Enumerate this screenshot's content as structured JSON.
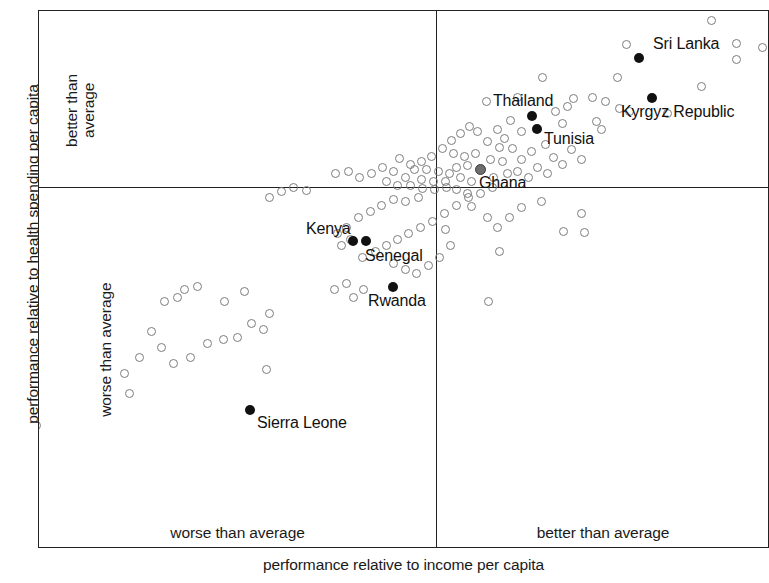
{
  "figure": {
    "type": "scatter",
    "x_axis_title": "performance relative to income per capita",
    "y_axis_title": "performance relative to health spending per capita",
    "quadrant_labels": {
      "y_upper": "better than\naverage",
      "y_upper_line1": "better than",
      "y_upper_line2": "average",
      "y_lower": "worse than average",
      "x_left": "worse than average",
      "x_right": "better than average"
    },
    "colors": {
      "frame": "#222222",
      "open_point": "#7c7c7c",
      "highlight_point": "#111111",
      "gray_point": "#6e6e6e",
      "text": "#1a1a1a",
      "background": "#ffffff"
    }
  },
  "chart_data": {
    "type": "scatter",
    "title": "",
    "xlabel": "performance relative to income per capita",
    "ylabel": "performance relative to health spending per capita",
    "grid": false,
    "legend": "none",
    "axis_origin_note": "Axes are divided into quadrants by an origin representing the average; no numeric tick labels are shown.",
    "quadrants": [
      "worse than average (income) / better than average (spending)",
      "better than average (income) / better than average (spending)",
      "worse than average (income) / worse than average (spending)",
      "better than average (income) / worse than average (spending)"
    ],
    "origin_px": {
      "x": 435,
      "y": 186
    },
    "plot_area_px": {
      "left": 38,
      "top": 10,
      "width": 731,
      "height": 538
    },
    "labeled_points": [
      {
        "name": "Sri Lanka",
        "style": "filled",
        "px": [
          638,
          57
        ],
        "label_px": [
          652,
          35
        ],
        "quadrant": "better/better"
      },
      {
        "name": "Kyrgyz Republic",
        "style": "filled",
        "px": [
          651,
          97
        ],
        "label_px": [
          620,
          103
        ],
        "quadrant": "better/better"
      },
      {
        "name": "Thailand",
        "style": "filled",
        "px": [
          531,
          115
        ],
        "label_px": [
          492,
          92
        ],
        "quadrant": "better/better"
      },
      {
        "name": "Tunisia",
        "style": "filled",
        "px": [
          536,
          128
        ],
        "label_px": [
          543,
          130
        ],
        "quadrant": "better/better"
      },
      {
        "name": "Ghana",
        "style": "gray",
        "px": [
          479,
          168
        ],
        "label_px": [
          478,
          174
        ],
        "quadrant": "better/better"
      },
      {
        "name": "Kenya",
        "style": "filled",
        "px": [
          352,
          240
        ],
        "label_px": [
          305,
          220
        ],
        "quadrant": "worse/worse"
      },
      {
        "name": "Senegal",
        "style": "filled",
        "px": [
          365,
          240
        ],
        "label_px": [
          364,
          247
        ],
        "quadrant": "worse/worse"
      },
      {
        "name": "Rwanda",
        "style": "filled",
        "px": [
          392,
          286
        ],
        "label_px": [
          367,
          292
        ],
        "quadrant": "worse/worse"
      },
      {
        "name": "Sierra Leone",
        "style": "filled",
        "px": [
          249,
          409
        ],
        "label_px": [
          256,
          414
        ],
        "quadrant": "worse/worse"
      }
    ],
    "unlabeled_points_px": [
      [
        710,
        19
      ],
      [
        625,
        43
      ],
      [
        735,
        42
      ],
      [
        735,
        58
      ],
      [
        761,
        46
      ],
      [
        616,
        76
      ],
      [
        700,
        85
      ],
      [
        666,
        112
      ],
      [
        541,
        76
      ],
      [
        591,
        96
      ],
      [
        604,
        100
      ],
      [
        572,
        97
      ],
      [
        566,
        105
      ],
      [
        554,
        110
      ],
      [
        595,
        120
      ],
      [
        561,
        122
      ],
      [
        600,
        128
      ],
      [
        618,
        107
      ],
      [
        628,
        110
      ],
      [
        485,
        100
      ],
      [
        516,
        96
      ],
      [
        509,
        119
      ],
      [
        520,
        130
      ],
      [
        496,
        128
      ],
      [
        503,
        137
      ],
      [
        468,
        125
      ],
      [
        476,
        130
      ],
      [
        486,
        140
      ],
      [
        498,
        146
      ],
      [
        511,
        147
      ],
      [
        459,
        132
      ],
      [
        450,
        139
      ],
      [
        441,
        147
      ],
      [
        452,
        152
      ],
      [
        463,
        155
      ],
      [
        474,
        152
      ],
      [
        489,
        158
      ],
      [
        501,
        160
      ],
      [
        466,
        164
      ],
      [
        455,
        166
      ],
      [
        520,
        158
      ],
      [
        530,
        150
      ],
      [
        544,
        143
      ],
      [
        552,
        156
      ],
      [
        536,
        166
      ],
      [
        516,
        170
      ],
      [
        506,
        172
      ],
      [
        492,
        176
      ],
      [
        527,
        176
      ],
      [
        546,
        172
      ],
      [
        561,
        163
      ],
      [
        570,
        148
      ],
      [
        580,
        158
      ],
      [
        430,
        155
      ],
      [
        420,
        160
      ],
      [
        409,
        163
      ],
      [
        398,
        157
      ],
      [
        413,
        168
      ],
      [
        425,
        168
      ],
      [
        437,
        170
      ],
      [
        448,
        172
      ],
      [
        459,
        176
      ],
      [
        470,
        180
      ],
      [
        444,
        180
      ],
      [
        432,
        180
      ],
      [
        420,
        178
      ],
      [
        404,
        176
      ],
      [
        392,
        170
      ],
      [
        381,
        166
      ],
      [
        370,
        172
      ],
      [
        358,
        176
      ],
      [
        347,
        170
      ],
      [
        334,
        172
      ],
      [
        385,
        180
      ],
      [
        396,
        184
      ],
      [
        409,
        184
      ],
      [
        421,
        187
      ],
      [
        433,
        188
      ],
      [
        445,
        186
      ],
      [
        417,
        196
      ],
      [
        404,
        200
      ],
      [
        392,
        198
      ],
      [
        380,
        204
      ],
      [
        369,
        210
      ],
      [
        357,
        216
      ],
      [
        345,
        226
      ],
      [
        336,
        232
      ],
      [
        349,
        238
      ],
      [
        340,
        244
      ],
      [
        361,
        256
      ],
      [
        374,
        250
      ],
      [
        385,
        244
      ],
      [
        396,
        238
      ],
      [
        407,
        232
      ],
      [
        419,
        226
      ],
      [
        431,
        220
      ],
      [
        443,
        212
      ],
      [
        455,
        204
      ],
      [
        467,
        196
      ],
      [
        479,
        192
      ],
      [
        491,
        186
      ],
      [
        444,
        228
      ],
      [
        449,
        244
      ],
      [
        438,
        256
      ],
      [
        427,
        264
      ],
      [
        415,
        272
      ],
      [
        404,
        268
      ],
      [
        392,
        262
      ],
      [
        486,
        216
      ],
      [
        496,
        226
      ],
      [
        470,
        205
      ],
      [
        487,
        300
      ],
      [
        466,
        192
      ],
      [
        455,
        188
      ],
      [
        305,
        189
      ],
      [
        292,
        186
      ],
      [
        280,
        190
      ],
      [
        268,
        196
      ],
      [
        352,
        296
      ],
      [
        362,
        288
      ],
      [
        345,
        282
      ],
      [
        333,
        288
      ],
      [
        196,
        285
      ],
      [
        183,
        288
      ],
      [
        176,
        296
      ],
      [
        243,
        290
      ],
      [
        223,
        300
      ],
      [
        163,
        300
      ],
      [
        150,
        330
      ],
      [
        160,
        346
      ],
      [
        138,
        356
      ],
      [
        172,
        362
      ],
      [
        189,
        356
      ],
      [
        206,
        342
      ],
      [
        222,
        338
      ],
      [
        236,
        336
      ],
      [
        250,
        322
      ],
      [
        262,
        328
      ],
      [
        268,
        312
      ],
      [
        123,
        372
      ],
      [
        265,
        368
      ],
      [
        128,
        392
      ],
      [
        35,
        424
      ],
      [
        33,
        448
      ],
      [
        580,
        212
      ],
      [
        583,
        231
      ],
      [
        562,
        230
      ],
      [
        498,
        250
      ],
      [
        508,
        216
      ],
      [
        540,
        200
      ],
      [
        520,
        206
      ]
    ],
    "point_count_note": "Approximately 150 country observations plotted as open circles, with 9 highlighted/labelled countries."
  }
}
